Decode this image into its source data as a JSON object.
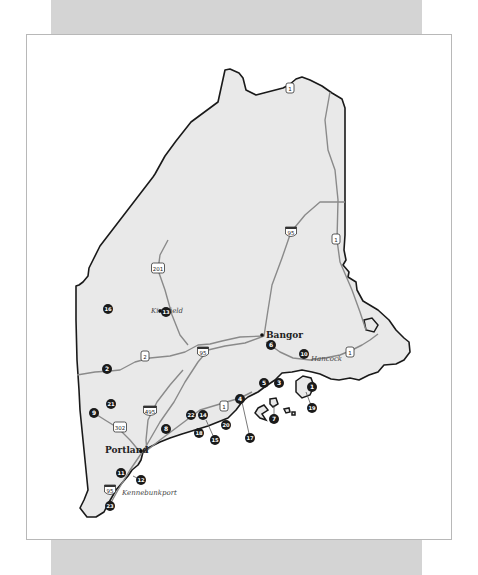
{
  "map": {
    "title": "",
    "state_fill": "#e9e9e9",
    "border_color": "#1a1a1a",
    "road_color": "#8a8a8a",
    "marker_color": "#1a1a1a",
    "cities": [
      {
        "name": "Kingfield",
        "style": "italic",
        "x": 151,
        "y": 313
      },
      {
        "name": "Bangor",
        "style": "bold",
        "x": 266,
        "y": 338
      },
      {
        "name": "Hancock",
        "style": "italic",
        "x": 311,
        "y": 361
      },
      {
        "name": "Portland",
        "style": "bold",
        "x": 105,
        "y": 453
      },
      {
        "name": "Kennebunkport",
        "style": "italic",
        "x": 122,
        "y": 495
      }
    ],
    "highway_shields": [
      {
        "label": "1",
        "type": "us",
        "x": 290,
        "y": 88
      },
      {
        "label": "1",
        "type": "us",
        "x": 336,
        "y": 239
      },
      {
        "label": "95",
        "type": "interstate",
        "x": 291,
        "y": 232
      },
      {
        "label": "201",
        "type": "us",
        "x": 158,
        "y": 268
      },
      {
        "label": "2",
        "type": "us",
        "x": 145,
        "y": 356
      },
      {
        "label": "95",
        "type": "interstate",
        "x": 203,
        "y": 352
      },
      {
        "label": "495",
        "type": "interstate",
        "x": 150,
        "y": 411
      },
      {
        "label": "302",
        "type": "us",
        "x": 120,
        "y": 427
      },
      {
        "label": "1",
        "type": "us",
        "x": 224,
        "y": 406
      },
      {
        "label": "1",
        "type": "us",
        "x": 350,
        "y": 352
      },
      {
        "label": "95",
        "type": "interstate",
        "x": 110,
        "y": 490
      }
    ],
    "markers": [
      {
        "n": "1",
        "x": 312,
        "y": 387
      },
      {
        "n": "2",
        "x": 107,
        "y": 369
      },
      {
        "n": "3",
        "x": 279,
        "y": 383
      },
      {
        "n": "4",
        "x": 240,
        "y": 399
      },
      {
        "n": "5",
        "x": 264,
        "y": 383
      },
      {
        "n": "6",
        "x": 271,
        "y": 345
      },
      {
        "n": "7",
        "x": 274,
        "y": 419
      },
      {
        "n": "8",
        "x": 166,
        "y": 429
      },
      {
        "n": "9",
        "x": 94,
        "y": 413
      },
      {
        "n": "10",
        "x": 304,
        "y": 354
      },
      {
        "n": "11",
        "x": 121,
        "y": 473
      },
      {
        "n": "12",
        "x": 141,
        "y": 480
      },
      {
        "n": "13",
        "x": 166,
        "y": 312
      },
      {
        "n": "14",
        "x": 203,
        "y": 415
      },
      {
        "n": "15",
        "x": 215,
        "y": 440
      },
      {
        "n": "16",
        "x": 108,
        "y": 309
      },
      {
        "n": "17",
        "x": 250,
        "y": 438
      },
      {
        "n": "18",
        "x": 199,
        "y": 433
      },
      {
        "n": "19",
        "x": 312,
        "y": 408
      },
      {
        "n": "20",
        "x": 226,
        "y": 425
      },
      {
        "n": "21",
        "x": 111,
        "y": 404
      },
      {
        "n": "22",
        "x": 191,
        "y": 415
      },
      {
        "n": "23",
        "x": 110,
        "y": 506
      }
    ]
  }
}
